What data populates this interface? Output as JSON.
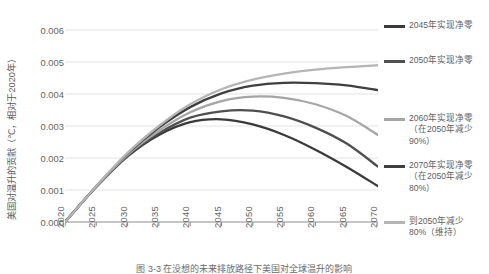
{
  "chart_data": {
    "type": "line",
    "title": "",
    "xlabel": "",
    "ylabel": "美国对温升的贡献（℃，相对于2020年）",
    "xlim": [
      2020,
      2070
    ],
    "ylim": [
      0.0,
      0.006
    ],
    "grid": true,
    "legend_position": "right",
    "x_ticks": [
      "2020",
      "2025",
      "2030",
      "2035",
      "2040",
      "2045",
      "2050",
      "2055",
      "2060",
      "2065",
      "2070"
    ],
    "y_ticks": [
      "0.000",
      "0.001",
      "0.002",
      "0.003",
      "0.004",
      "0.005",
      "0.006"
    ],
    "x": [
      2020,
      2025,
      2030,
      2035,
      2040,
      2045,
      2050,
      2055,
      2060,
      2065,
      2070
    ],
    "series": [
      {
        "name": "2045年实现净零",
        "color": "#3a3a3a",
        "values": [
          0.0,
          0.0011,
          0.00205,
          0.00272,
          0.00312,
          0.00321,
          0.00305,
          0.00272,
          0.00226,
          0.00172,
          0.00112
        ]
      },
      {
        "name": "2050年实现净零",
        "color": "#4f4f4f",
        "values": [
          0.0,
          0.0011,
          0.00207,
          0.00277,
          0.00326,
          0.00346,
          0.00348,
          0.0033,
          0.00295,
          0.00245,
          0.00173
        ]
      },
      {
        "name": "2060年实现净零\n（在2050年减少90%）",
        "color": "#a6a6a6",
        "values": [
          0.0,
          0.00111,
          0.0021,
          0.00285,
          0.00343,
          0.00378,
          0.00392,
          0.00388,
          0.00368,
          0.00331,
          0.00272
        ]
      },
      {
        "name": "2070年实现净零\n（在2050年减少80%）",
        "color": "#3f3f3f",
        "values": [
          0.0,
          0.00112,
          0.00214,
          0.00295,
          0.00359,
          0.00402,
          0.00426,
          0.00435,
          0.00434,
          0.00427,
          0.00412
        ]
      },
      {
        "name": "到2050年减少80%（维持）",
        "color": "#b5b5b5",
        "values": [
          0.0,
          0.00112,
          0.00216,
          0.003,
          0.00368,
          0.00415,
          0.00445,
          0.00464,
          0.00476,
          0.00484,
          0.0049
        ]
      }
    ]
  },
  "legend": {
    "items": [
      {
        "label": "2045年实现净零",
        "color": "#3a3a3a"
      },
      {
        "label": "2050年实现净零",
        "color": "#4f4f4f"
      },
      {
        "label": "2060年实现净零\n（在2050年减少\n90%）",
        "color": "#a6a6a6"
      },
      {
        "label": "2070年实现净零\n（在2050年减少\n80%）",
        "color": "#3f3f3f"
      },
      {
        "label": "到2050年减少\n80%（维持）",
        "color": "#b5b5b5"
      }
    ]
  },
  "caption": {
    "text": "图 3-3   在没想的未来排放路径下美国对全球温升的影响"
  },
  "colors": {
    "gridline": "#e3e3e3",
    "axis": "#8c8c8c",
    "tick_text": "#636363"
  }
}
